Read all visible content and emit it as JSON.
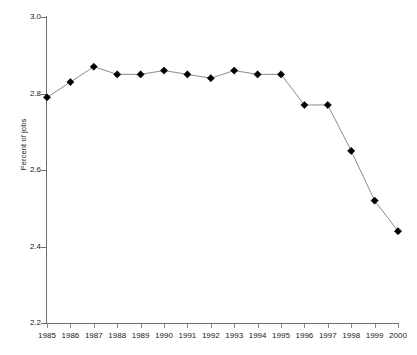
{
  "chart_data": {
    "type": "line",
    "title": "",
    "xlabel": "",
    "ylabel": "Percent of jobs",
    "categories": [
      "1985",
      "1986",
      "1987",
      "1988",
      "1989",
      "1990",
      "1991",
      "1992",
      "1993",
      "1994",
      "1995",
      "1996",
      "1997",
      "1998",
      "1999",
      "2000"
    ],
    "values": [
      2.79,
      2.83,
      2.87,
      2.85,
      2.85,
      2.86,
      2.85,
      2.84,
      2.86,
      2.85,
      2.85,
      2.77,
      2.77,
      2.65,
      2.52,
      2.44
    ],
    "ylim": [
      2.2,
      3.0
    ],
    "ytick_labels": [
      "3.0",
      "2.8",
      "2.6",
      "2.4",
      "2.2"
    ],
    "ytick_values": [
      3.0,
      2.8,
      2.6,
      2.4,
      2.2
    ],
    "grid": false,
    "legend": "none",
    "marker_shape": "diamond",
    "line_color": "#8c8c8c",
    "marker_color": "#000000",
    "axis_color": "#6e6e6e",
    "background": "#ffffff"
  }
}
